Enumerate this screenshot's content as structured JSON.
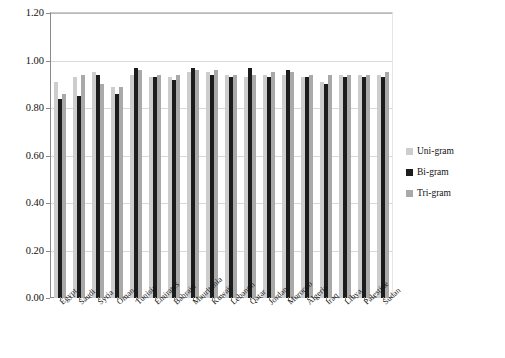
{
  "chart_data": {
    "type": "bar",
    "title": "",
    "xlabel": "",
    "ylabel": "",
    "ylim": [
      0.0,
      1.2
    ],
    "ytick_values": [
      0.0,
      0.2,
      0.4,
      0.6,
      0.8,
      1.0,
      1.2
    ],
    "ytick_labels": [
      "0.00",
      "0.20",
      "0.40",
      "0.60",
      "0.80",
      "1.00",
      "1.20"
    ],
    "grid": true,
    "legend_position": "right",
    "categories": [
      "Egypt",
      "Saudi",
      "Syria",
      "Oman",
      "Tunisia",
      "Emirates",
      "Bahrain",
      "Mauritania",
      "Kuwait",
      "Lebanon",
      "Qatar",
      "Jordan",
      "Morocco",
      "Algeria",
      "Iraq",
      "Libya",
      "Palestine",
      "Sudan"
    ],
    "series": [
      {
        "name": "Uni-gram",
        "color": "#cdcdcd",
        "values": [
          0.91,
          0.93,
          0.95,
          0.89,
          0.94,
          0.93,
          0.93,
          0.95,
          0.95,
          0.94,
          0.93,
          0.94,
          0.94,
          0.93,
          0.91,
          0.94,
          0.94,
          0.94
        ]
      },
      {
        "name": "Bi-gram",
        "color": "#1c1c1c",
        "values": [
          0.84,
          0.85,
          0.94,
          0.86,
          0.97,
          0.93,
          0.92,
          0.97,
          0.94,
          0.93,
          0.97,
          0.93,
          0.96,
          0.93,
          0.9,
          0.93,
          0.93,
          0.93
        ]
      },
      {
        "name": "Tri-gram",
        "color": "#a9a9a9",
        "values": [
          0.86,
          0.94,
          0.9,
          0.89,
          0.96,
          0.94,
          0.94,
          0.96,
          0.96,
          0.94,
          0.94,
          0.95,
          0.95,
          0.94,
          0.94,
          0.94,
          0.94,
          0.95
        ]
      }
    ]
  },
  "legend": {
    "items": [
      {
        "label": "Uni-gram",
        "swatch": "uni"
      },
      {
        "label": "Bi-gram",
        "swatch": "bi"
      },
      {
        "label": "Tri-gram",
        "swatch": "tri"
      }
    ]
  }
}
